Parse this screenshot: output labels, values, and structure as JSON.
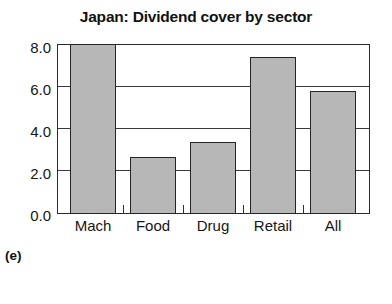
{
  "chart_data": {
    "type": "bar",
    "title": "Japan: Dividend cover by sector",
    "xlabel": "",
    "ylabel": "",
    "categories": [
      "Mach",
      "Food",
      "Drug",
      "Retail",
      "All"
    ],
    "values": [
      8.0,
      2.7,
      3.4,
      7.4,
      5.8
    ],
    "ylim": [
      0.0,
      8.0
    ],
    "yticks": [
      "0.0",
      "2.0",
      "4.0",
      "6.0",
      "8.0"
    ],
    "ytick_values": [
      0.0,
      2.0,
      4.0,
      6.0,
      8.0
    ],
    "grid": true,
    "legend": false,
    "bar_color": "#b7b7b7",
    "bar_edge_color": "#242424",
    "axis_color": "#2b2b2b"
  },
  "caption": {
    "panel_label": "(e)"
  }
}
